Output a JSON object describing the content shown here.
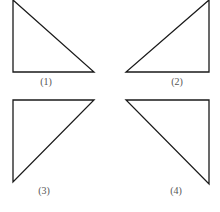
{
  "figure": {
    "stroke_color": "#1a1a1a",
    "label_color": "#555555",
    "triangles": [
      {
        "label": "(1)",
        "points": "13,0 13,72 94,72",
        "label_x": 53,
        "label_y": 77
      },
      {
        "label": "(2)",
        "points": "209,0 209,72 126,72",
        "label_x": 176,
        "label_y": 77
      },
      {
        "label": "(3)",
        "points": "13,100 94,100 13,182",
        "label_x": 44,
        "label_y": 185
      },
      {
        "label": "(4)",
        "points": "126,100 209,100 209,184",
        "label_x": 176,
        "label_y": 185
      }
    ]
  }
}
